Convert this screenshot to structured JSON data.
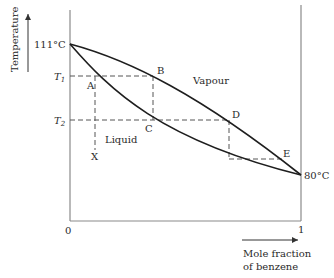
{
  "diagram": {
    "y_axis_label": "Temperature",
    "x_axis_label_line1": "Mole fraction",
    "x_axis_label_line2": "of benzene",
    "x_tick_min": "0",
    "x_tick_max": "1",
    "temp_high": "111°C",
    "temp_low": "80°C",
    "t1_label": "T",
    "t1_sub": "1",
    "t2_label": "T",
    "t2_sub": "2",
    "region_vapour": "Vapour",
    "region_liquid": "Liquid",
    "points": {
      "A": "A",
      "B": "B",
      "C": "C",
      "D": "D",
      "E": "E",
      "X": "X"
    },
    "curves": [
      {
        "name": "vapour-curve",
        "description": "upper (dew point) curve from 111°C at x=0 to 80°C at x=1"
      },
      {
        "name": "liquid-curve",
        "description": "lower (boiling point) curve from 111°C at x=0 to 80°C at x=1"
      }
    ]
  }
}
